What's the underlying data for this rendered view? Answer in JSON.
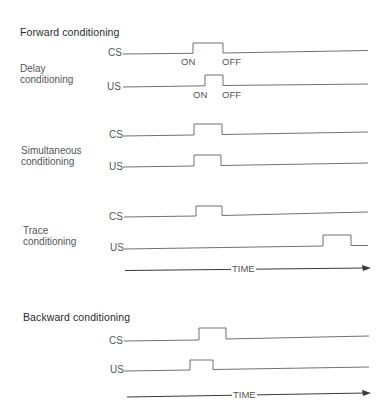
{
  "sections": [
    {
      "heading": "Forward conditioning",
      "paradigms": [
        {
          "name": "Delay conditioning",
          "label_lines": [
            "Delay",
            "conditioning"
          ],
          "signals": [
            {
              "label": "CS",
              "on_label": "ON",
              "off_label": "OFF"
            },
            {
              "label": "US",
              "on_label": "ON",
              "off_label": "OFF"
            }
          ]
        },
        {
          "name": "Simultaneous conditioning",
          "label_lines": [
            "Simultaneous",
            "conditioning"
          ],
          "signals": [
            {
              "label": "CS"
            },
            {
              "label": "US"
            }
          ]
        },
        {
          "name": "Trace conditioning",
          "label_lines": [
            "Trace",
            "conditioning"
          ],
          "signals": [
            {
              "label": "CS"
            },
            {
              "label": "US"
            }
          ]
        }
      ],
      "time_axis_label": "TIME"
    },
    {
      "heading": "Backward conditioning",
      "paradigms": [
        {
          "name": "Backward conditioning",
          "signals": [
            {
              "label": "CS"
            },
            {
              "label": "US"
            }
          ]
        }
      ],
      "time_axis_label": "TIME"
    }
  ],
  "colors": {
    "line": "#6a6a6a",
    "arrow": "#3a3a3a",
    "text": "#555555"
  }
}
